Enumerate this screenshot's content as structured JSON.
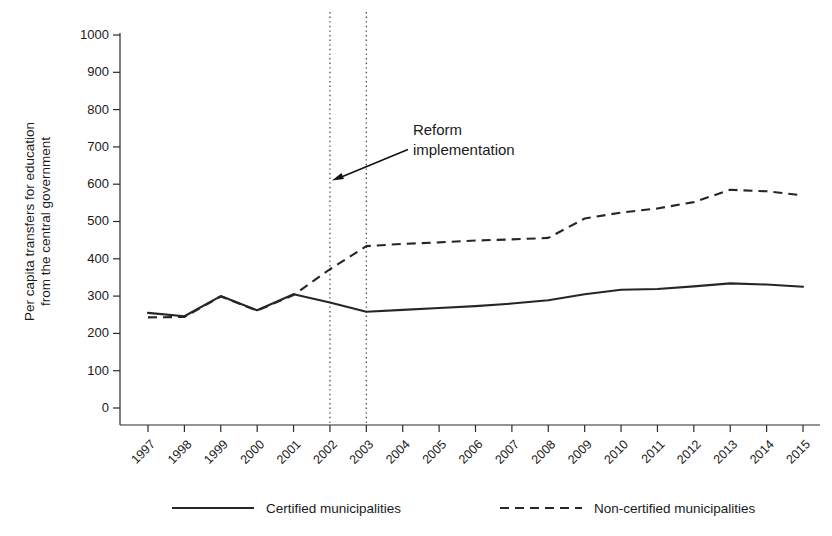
{
  "chart_data": {
    "type": "line",
    "title": "",
    "xlabel": "",
    "ylabel": "Per capita transfers for education from the central government",
    "ylabel_line1": "Per capita transfers for education",
    "ylabel_line2": "from the central government",
    "categories": [
      "1997",
      "1998",
      "1999",
      "2000",
      "2001",
      "2002",
      "2003",
      "2004",
      "2005",
      "2006",
      "2007",
      "2008",
      "2009",
      "2010",
      "2011",
      "2012",
      "2013",
      "2014",
      "2015"
    ],
    "x": [
      1997,
      1998,
      1999,
      2000,
      2001,
      2002,
      2003,
      2004,
      2005,
      2006,
      2007,
      2008,
      2009,
      2010,
      2011,
      2012,
      2013,
      2014,
      2015
    ],
    "ylim": [
      0,
      1000
    ],
    "xlim": [
      1997,
      2015
    ],
    "yticks": [
      0,
      100,
      200,
      300,
      400,
      500,
      600,
      700,
      800,
      900,
      1000
    ],
    "ytick_labels": [
      "0",
      "100",
      "200",
      "300",
      "400",
      "500",
      "600",
      "700",
      "800",
      "900",
      "1000"
    ],
    "grid": false,
    "legend_position": "below",
    "series": [
      {
        "name": "Certified municipalities",
        "style": "solid",
        "color": "#262626",
        "values": [
          255,
          246,
          300,
          262,
          305,
          283,
          258,
          263,
          268,
          273,
          280,
          289,
          305,
          317,
          319,
          326,
          334,
          331,
          325
        ]
      },
      {
        "name": "Non-certified municipalities",
        "style": "dashed",
        "color": "#262626",
        "values": [
          243,
          244,
          299,
          261,
          303,
          372,
          434,
          440,
          444,
          449,
          452,
          456,
          508,
          524,
          535,
          552,
          585,
          581,
          570
        ]
      }
    ],
    "annotations": [
      {
        "text_line1": "Reform",
        "text_line2": "implementation",
        "points_to_year": 2002,
        "points_to_value": 610
      }
    ],
    "vertical_reference_lines": [
      {
        "year": 2002,
        "style": "dotted"
      },
      {
        "year": 2003,
        "style": "dotted"
      }
    ]
  },
  "legend": {
    "items": [
      {
        "label": "Certified municipalities",
        "style": "solid"
      },
      {
        "label": "Non-certified municipalities",
        "style": "dashed"
      }
    ]
  }
}
